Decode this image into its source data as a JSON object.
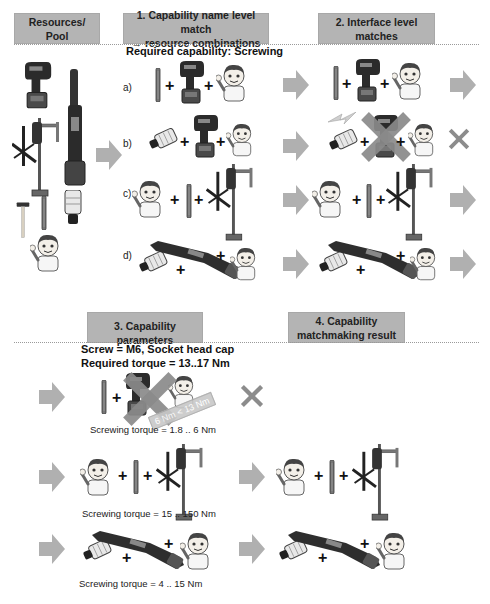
{
  "headers": {
    "resources": "Resources/\nPool",
    "resources_l1": "Resources/",
    "resources_l2": "Pool",
    "step1_l1": "1. Capability name level match",
    "step1_l2": "→ resource combinations",
    "step2_l1": "2. Interface level",
    "step2_l2": "matches",
    "step3": "3. Capability parameters",
    "step4_l1": "4. Capability",
    "step4_l2": "matchmaking result"
  },
  "required_capability": "Required capability: Screwing",
  "parameters": {
    "screw": "Screw = M6, Socket head cap",
    "required_torque": "Required torque = 13..17 Nm"
  },
  "combinations": [
    {
      "label": "a)",
      "items": [
        "screwdriver-bit",
        "cordless-drill",
        "worker"
      ],
      "interface_match": true
    },
    {
      "label": "b)",
      "items": [
        "socket-bit",
        "cordless-drill",
        "worker"
      ],
      "interface_match": false
    },
    {
      "label": "c)",
      "items": [
        "worker",
        "screwdriver-bit",
        "mounted-nutrunner"
      ],
      "interface_match": true
    },
    {
      "label": "d)",
      "items": [
        "socket-bit",
        "angle-nutrunner",
        "worker"
      ],
      "interface_match": true
    }
  ],
  "parameter_results": [
    {
      "torque": "Screwing torque = 1.8 .. 6 Nm",
      "rejected": true,
      "reason": "6 Nm < 13 Nm"
    },
    {
      "torque": "Screwing torque = 15 .. 150 Nm",
      "rejected": false
    },
    {
      "torque": "Screwing torque = 4 .. 15 Nm",
      "rejected": false
    }
  ],
  "colors": {
    "header_bg": "#b4b4b4",
    "arrow": "#b0b0b0",
    "cross": "#8c8c8c",
    "tool_dark": "#2e2e2e",
    "battery": "#4a4a4a"
  }
}
